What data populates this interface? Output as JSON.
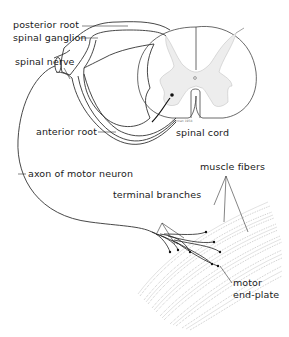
{
  "diagram": {
    "labels": {
      "posterior_root": "posterior root",
      "spinal_ganglion": "spinal ganglion",
      "spinal_nerve": "spinal nerve",
      "anterior_root": "anterior root",
      "spinal_cord": "spinal cord",
      "axon_of_motor_neuron": "axon of motor neuron",
      "muscle_fibers": "muscle fibers",
      "terminal_branches": "terminal branches",
      "motor_end_plate_line1": "motor",
      "motor_end_plate_line2": "end-plate"
    },
    "artist_signature": "Dunnan 1958",
    "colors": {
      "line": "#333333",
      "grey_matter": "#ececec",
      "fiber": "#9a9a9a",
      "background": "#ffffff"
    }
  }
}
